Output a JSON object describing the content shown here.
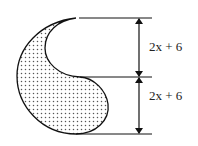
{
  "diagram": {
    "dimensions": [
      {
        "label": "2x + 6",
        "segment": "upper"
      },
      {
        "label": "2x + 6",
        "segment": "lower"
      }
    ],
    "colors": {
      "stroke": "#111111",
      "shade_dots": "#555555",
      "background": "#ffffff"
    }
  }
}
